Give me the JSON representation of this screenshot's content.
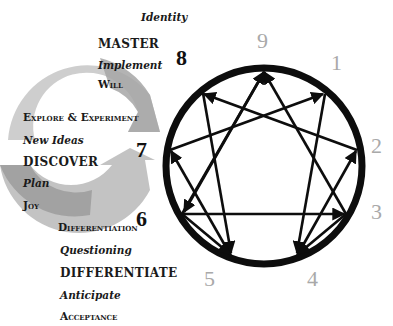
{
  "diagram": {
    "type": "enneagram",
    "colors": {
      "circle": "#0d0d0d",
      "dark_numbers": "#111111",
      "gray_numbers": "#a9a9a9",
      "cycle_arrow_light": "#c8c8c8",
      "cycle_arrow_dark": "#9a9a9a"
    },
    "numbers": [
      {
        "id": "9",
        "label": "9",
        "tone": "gray"
      },
      {
        "id": "1",
        "label": "1",
        "tone": "gray"
      },
      {
        "id": "2",
        "label": "2",
        "tone": "gray"
      },
      {
        "id": "3",
        "label": "3",
        "tone": "gray"
      },
      {
        "id": "4",
        "label": "4",
        "tone": "gray"
      },
      {
        "id": "5",
        "label": "5",
        "tone": "gray"
      },
      {
        "id": "6",
        "label": "6",
        "tone": "dark"
      },
      {
        "id": "7",
        "label": "7",
        "tone": "dark"
      },
      {
        "id": "8",
        "label": "8",
        "tone": "dark"
      }
    ],
    "arrows": [
      {
        "from": "3",
        "to": "9"
      },
      {
        "from": "6",
        "to": "9"
      },
      {
        "from": "6",
        "to": "3"
      },
      {
        "from": "1",
        "to": "4"
      },
      {
        "from": "4",
        "to": "2"
      },
      {
        "from": "2",
        "to": "8"
      },
      {
        "from": "8",
        "to": "5"
      },
      {
        "from": "5",
        "to": "7"
      },
      {
        "from": "7",
        "to": "1"
      }
    ]
  },
  "labels": {
    "identity": "Identity",
    "master": "MASTER",
    "implement": "Implement",
    "will": "Will",
    "explore": "Explore & Experiment",
    "new_ideas": "New Ideas",
    "discover": "DISCOVER",
    "plan": "Plan",
    "joy": "Joy",
    "differentiation": "Differentiation",
    "questioning": "Questioning",
    "differentiate": "DIFFERENTIATE",
    "anticipate": "Anticipate",
    "acceptance": "Acceptance"
  }
}
